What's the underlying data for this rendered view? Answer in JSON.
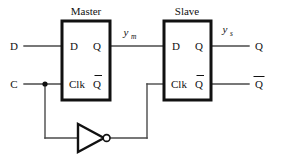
{
  "diagram": {
    "type": "logic-circuit-schematic",
    "colors": {
      "background": "#ffffff",
      "wire": "#4a4a4a",
      "outline": "#111111",
      "text": "#111111"
    },
    "blocks": [
      {
        "id": "master",
        "caption": "Master",
        "ports": {
          "input_data": "D",
          "input_clock": "Clk",
          "output_q": "Q",
          "output_qbar": "Q"
        }
      },
      {
        "id": "slave",
        "caption": "Slave",
        "ports": {
          "input_data": "D",
          "input_clock": "Clk",
          "output_q": "Q",
          "output_qbar": "Q"
        }
      }
    ],
    "external_inputs": [
      {
        "id": "d-input",
        "label": "D"
      },
      {
        "id": "c-input",
        "label": "C"
      }
    ],
    "external_outputs": [
      {
        "id": "q-output",
        "label": "Q"
      },
      {
        "id": "qbar-output",
        "label": "Q"
      }
    ],
    "net_labels": [
      {
        "id": "master-output-net",
        "base": "y",
        "subscript": "m"
      },
      {
        "id": "slave-output-net",
        "base": "y",
        "subscript": "s"
      }
    ],
    "gates": [
      {
        "id": "clock-inverter",
        "type": "NOT",
        "label": ""
      }
    ]
  }
}
